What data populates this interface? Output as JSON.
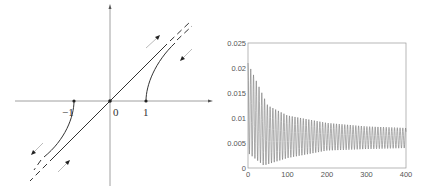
{
  "diagram": {
    "labels": {
      "neg_one": "−1",
      "zero": "0",
      "one": "1"
    }
  },
  "chart_data": {
    "type": "line",
    "title": "",
    "xlabel": "",
    "ylabel": "",
    "xlim": [
      0,
      400
    ],
    "ylim": [
      0,
      0.025
    ],
    "xticks": [
      "0",
      "100",
      "200",
      "300",
      "400"
    ],
    "yticks": [
      "0",
      "0.005",
      "0.01",
      "0.015",
      "0.02",
      "0.025"
    ],
    "grid": false,
    "series": [
      {
        "name": "oscillation",
        "description": "Damped oscillation; upper envelope decays from ~0.021 to ~0.008, lower envelope rises from ~0.0005 to ~0.004",
        "envelope_upper": [
          [
            0,
            0.021
          ],
          [
            50,
            0.0125
          ],
          [
            100,
            0.0105
          ],
          [
            200,
            0.009
          ],
          [
            300,
            0.0083
          ],
          [
            400,
            0.008
          ]
        ],
        "envelope_lower": [
          [
            0,
            0.003
          ],
          [
            40,
            0.0005
          ],
          [
            100,
            0.002
          ],
          [
            200,
            0.0035
          ],
          [
            300,
            0.0038
          ],
          [
            400,
            0.004
          ]
        ]
      }
    ]
  }
}
